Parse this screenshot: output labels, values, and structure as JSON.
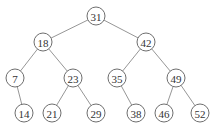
{
  "diagram": {
    "type": "binary-search-tree",
    "nodes": [
      {
        "id": "n31",
        "label": "31",
        "x": 96,
        "y": 16
      },
      {
        "id": "n18",
        "label": "18",
        "x": 43,
        "y": 42
      },
      {
        "id": "n42",
        "label": "42",
        "x": 146,
        "y": 42
      },
      {
        "id": "n7",
        "label": "7",
        "x": 15,
        "y": 78
      },
      {
        "id": "n23",
        "label": "23",
        "x": 73,
        "y": 78
      },
      {
        "id": "n35",
        "label": "35",
        "x": 117,
        "y": 78
      },
      {
        "id": "n49",
        "label": "49",
        "x": 176,
        "y": 78
      },
      {
        "id": "n14",
        "label": "14",
        "x": 24,
        "y": 113
      },
      {
        "id": "n21",
        "label": "21",
        "x": 52,
        "y": 113
      },
      {
        "id": "n29",
        "label": "29",
        "x": 96,
        "y": 113
      },
      {
        "id": "n38",
        "label": "38",
        "x": 136,
        "y": 113
      },
      {
        "id": "n46",
        "label": "46",
        "x": 164,
        "y": 113
      },
      {
        "id": "n52",
        "label": "52",
        "x": 200,
        "y": 113
      }
    ],
    "edges": [
      [
        "n31",
        "n18"
      ],
      [
        "n31",
        "n42"
      ],
      [
        "n18",
        "n7"
      ],
      [
        "n18",
        "n23"
      ],
      [
        "n42",
        "n35"
      ],
      [
        "n42",
        "n49"
      ],
      [
        "n7",
        "n14"
      ],
      [
        "n23",
        "n21"
      ],
      [
        "n23",
        "n29"
      ],
      [
        "n35",
        "n38"
      ],
      [
        "n49",
        "n46"
      ],
      [
        "n49",
        "n52"
      ]
    ],
    "node_radius": 9
  }
}
